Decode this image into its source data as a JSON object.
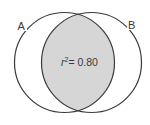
{
  "diagram": {
    "type": "venn",
    "sets": [
      {
        "label": "A",
        "cx": 64.5,
        "cy": 62.5,
        "r": 50
      },
      {
        "label": "B",
        "cx": 91.5,
        "cy": 62.5,
        "r": 50
      }
    ],
    "overlap_label_prefix": "r",
    "overlap_label_sup": "2",
    "overlap_label_value": "= 0.80",
    "colors": {
      "stroke": "#3a3a3a",
      "overlap_fill": "#d6d6d6",
      "background": "#ffffff"
    }
  }
}
